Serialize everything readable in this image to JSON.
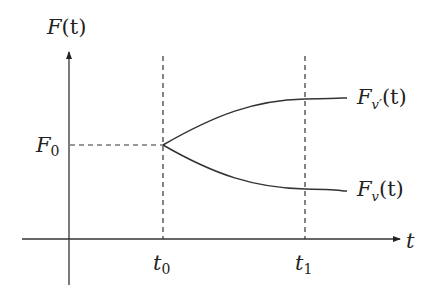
{
  "diagram": {
    "y_axis_label": {
      "main": "F",
      "paren": "(t)"
    },
    "x_axis_label": "t",
    "f0_label": {
      "main": "F",
      "sub": "0"
    },
    "t0_label": {
      "main": "t",
      "sub": "0"
    },
    "t1_label": {
      "main": "t",
      "sub": "1"
    },
    "upper_curve_label": {
      "main": "F",
      "sub": "v′",
      "paren": "(t)"
    },
    "lower_curve_label": {
      "main": "F",
      "sub": "v",
      "paren": "(t)"
    },
    "colors": {
      "line": "#333333",
      "text": "#222222",
      "background": "#ffffff"
    }
  }
}
